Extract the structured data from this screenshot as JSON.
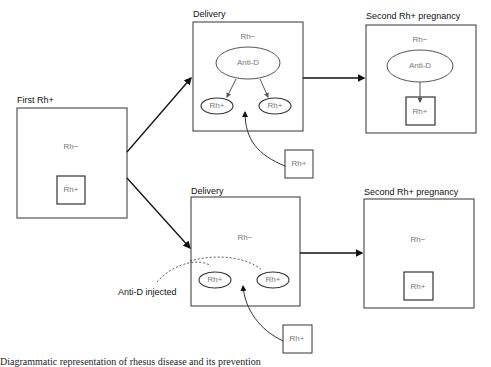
{
  "diagram": {
    "panels": {
      "first": {
        "label": "First Rh+",
        "mother": "Rh−",
        "fetus": "Rh+"
      },
      "top_delivery": {
        "label": "Delivery",
        "mother": "Rh−",
        "antibody": "Anti-D",
        "cells": [
          "Rh+",
          "Rh+"
        ],
        "incoming": "Rh+"
      },
      "top_second": {
        "label": "Second Rh+ pregnancy",
        "mother": "Rh−",
        "antibody": "Anti-D",
        "fetus": "Rh+"
      },
      "bottom_delivery": {
        "label": "Delivery",
        "mother": "Rh−",
        "cells": [
          "Rh+",
          "Rh+"
        ],
        "incoming": "Rh+",
        "annotation": "Anti-D injected"
      },
      "bottom_second": {
        "label": "Second Rh+ pregnancy",
        "mother": "Rh−",
        "fetus": "Rh+"
      }
    },
    "caption": "Diagrammatic representation of rhesus disease and its prevention"
  },
  "colors": {
    "line": "#111111",
    "box": "#333333",
    "inner_text": "#777777"
  }
}
